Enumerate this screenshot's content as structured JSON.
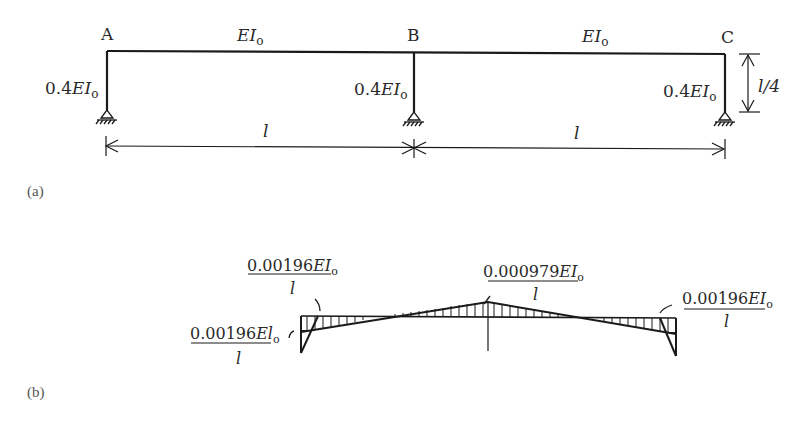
{
  "figure": {
    "panel_a": {
      "label": "(a)",
      "nodes": [
        "A",
        "B",
        "C"
      ],
      "beam_labels": [
        {
          "id": "AB",
          "stiffness": "EI",
          "subscript": "o"
        },
        {
          "id": "BC",
          "stiffness": "EI",
          "subscript": "o"
        }
      ],
      "column_labels": [
        {
          "node": "A",
          "prefix": "0.4",
          "stiffness": "EI",
          "subscript": "o"
        },
        {
          "node": "B",
          "prefix": "0.4",
          "stiffness": "EI",
          "subscript": "o"
        },
        {
          "node": "C",
          "prefix": "0.4",
          "stiffness": "EI",
          "subscript": "o"
        }
      ],
      "span_labels": [
        "l",
        "l"
      ],
      "height_label": "l/4"
    },
    "panel_b": {
      "label": "(b)",
      "annotations": {
        "left_top": {
          "num": "0.00196",
          "sym": "EI",
          "sub": "o",
          "den": "l"
        },
        "left_bottom": {
          "num": "0.00196",
          "sym": "El",
          "sub": "o",
          "den": "l"
        },
        "center": {
          "num": "0.000979",
          "sym": "EI",
          "sub": "o",
          "den": "l"
        },
        "right": {
          "num": "0.00196",
          "sym": "EI",
          "sub": "o",
          "den": "l"
        }
      }
    }
  }
}
